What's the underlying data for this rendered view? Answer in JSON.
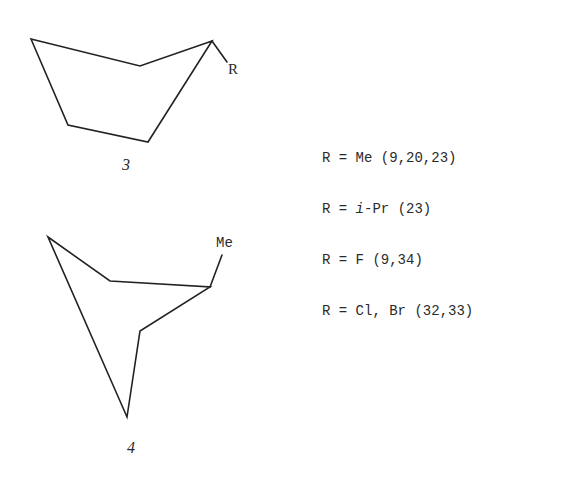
{
  "compounds": [
    {
      "id": "3",
      "label": "3",
      "substituent_label": "R",
      "ring_vertices": [
        [
          31,
          39
        ],
        [
          140,
          66
        ],
        [
          212,
          41
        ],
        [
          148,
          142
        ],
        [
          68,
          125
        ]
      ],
      "substituent_bond": [
        [
          212,
          41
        ],
        [
          227,
          62
        ]
      ]
    },
    {
      "id": "4",
      "label": "4",
      "substituent_label": "Me",
      "ring_vertices": [
        [
          48,
          237
        ],
        [
          110,
          281
        ],
        [
          210,
          287
        ],
        [
          140,
          331
        ],
        [
          127,
          417
        ]
      ],
      "substituent_bond": [
        [
          210,
          287
        ],
        [
          222,
          255
        ]
      ]
    }
  ],
  "legend": {
    "lines": [
      {
        "prefix": "R = ",
        "group": "Me",
        "group_italic_part": "",
        "refs": " (9,20,23)"
      },
      {
        "prefix": "R = ",
        "group": "-Pr",
        "group_italic_part": "i",
        "refs": " (23)"
      },
      {
        "prefix": "R = ",
        "group": "F",
        "group_italic_part": "",
        "refs": " (9,34)"
      },
      {
        "prefix": "R = ",
        "group": "Cl, Br",
        "group_italic_part": "",
        "refs": " (32,33)"
      }
    ]
  },
  "colors": {
    "ink": "#222222",
    "background": "#ffffff"
  }
}
